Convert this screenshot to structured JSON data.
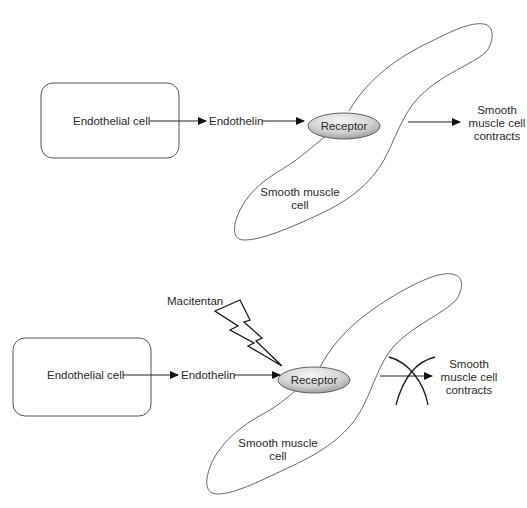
{
  "panels": [
    {
      "id": "normal",
      "endothelial_cell": "Endothelial cell",
      "endothelin": "Endothelin",
      "receptor": "Receptor",
      "smooth_muscle_cell": [
        "Smooth muscle",
        "cell"
      ],
      "outcome": [
        "Smooth",
        "muscle cell",
        "contracts"
      ],
      "blocked": false
    },
    {
      "id": "with-macitentan",
      "drug": "Macitentan",
      "drug_icon": "lightning-bolt-icon",
      "endothelial_cell": "Endothelial cell",
      "endothelin": "Endothelin",
      "receptor": "Receptor",
      "smooth_muscle_cell": [
        "Smooth muscle",
        "cell"
      ],
      "outcome": [
        "Smooth",
        "muscle cell",
        "contracts"
      ],
      "blocked": true,
      "blocked_icon": "cross-out-icon"
    }
  ],
  "colors": {
    "stroke": "#333333",
    "outline": "#555555",
    "receptor_fill_light": "#f4f4f4",
    "receptor_fill_dark": "#9a9a9a"
  }
}
